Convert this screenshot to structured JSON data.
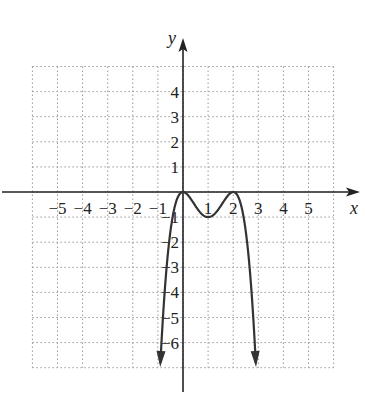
{
  "chart_data": {
    "type": "line",
    "title": "",
    "xlabel": "x",
    "ylabel": "y",
    "xlim": [
      -6,
      6
    ],
    "ylim": [
      -7,
      5
    ],
    "grid": true,
    "x_ticks": [
      "-5",
      "-4",
      "-3",
      "-2",
      "-1",
      "1",
      "2",
      "3",
      "4",
      "5"
    ],
    "y_ticks": [
      "4",
      "3",
      "2",
      "1",
      "-1",
      "-2",
      "-3",
      "-4",
      "-5",
      "-6"
    ],
    "series": [
      {
        "name": "f(x)",
        "description": "Polynomial with double zeros at x=0 and x=2, local min (1,-1), both ends falling with arrows",
        "points": [
          [
            -0.9,
            -6.8
          ],
          [
            -0.5,
            -1.56
          ],
          [
            0,
            0
          ],
          [
            0.5,
            -0.56
          ],
          [
            1,
            -1
          ],
          [
            1.5,
            -0.56
          ],
          [
            2,
            0
          ],
          [
            2.5,
            -1.56
          ],
          [
            2.9,
            -6.8
          ]
        ],
        "end_arrows": true
      }
    ]
  }
}
